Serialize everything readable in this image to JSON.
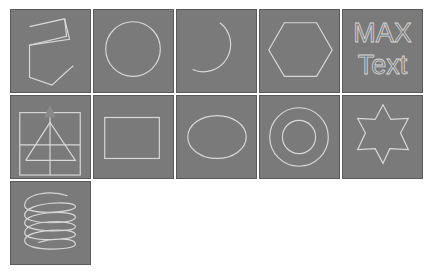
{
  "panel": {
    "title": "Shape Library",
    "tiles": [
      {
        "label": "Line",
        "icon": "line-shape-icon"
      },
      {
        "label": "Circle",
        "icon": "circle-shape-icon"
      },
      {
        "label": "Arc",
        "icon": "arc-shape-icon"
      },
      {
        "label": "NGon",
        "icon": "hexagon-shape-icon"
      },
      {
        "label": "Text",
        "icon": "text-shape-icon",
        "text_line1": "MAX",
        "text_line2": "Text"
      },
      {
        "label": "Section",
        "icon": "section-shape-icon"
      },
      {
        "label": "Rectangle",
        "icon": "rectangle-shape-icon"
      },
      {
        "label": "Ellipse",
        "icon": "ellipse-shape-icon"
      },
      {
        "label": "Donut",
        "icon": "donut-shape-icon"
      },
      {
        "label": "Star",
        "icon": "star-shape-icon"
      },
      {
        "label": "Helix",
        "icon": "helix-shape-icon"
      }
    ]
  },
  "colors": {
    "tile_bg": "#7a7a7a",
    "stroke": "#d8d8d8",
    "page_bg": "#ffffff"
  }
}
